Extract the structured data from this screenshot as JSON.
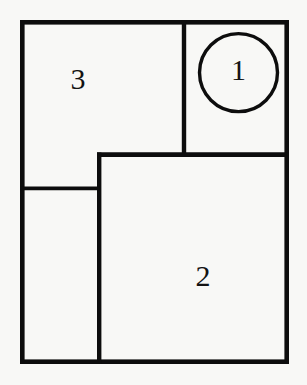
{
  "diagram": {
    "background_color": "#f8f8f6",
    "stroke_color": "#0d0d0d",
    "label_color": "#131313",
    "frame": {
      "name": "outer-rectangle",
      "x": 22.3,
      "y": 22.3,
      "width": 264.4,
      "height": 339.4,
      "stroke_width": 4.6
    },
    "dividers": [
      {
        "name": "divider-vertical-upper",
        "orientation": "vertical",
        "x1": 184.0,
        "y1": 20.0,
        "x2": 184.0,
        "y2": 156.5,
        "stroke_width": 4.4
      },
      {
        "name": "divider-horizontal-middle",
        "orientation": "horizontal",
        "x1": 97.0,
        "y1": 154.6,
        "x2": 289.0,
        "y2": 154.6,
        "stroke_width": 4.6
      },
      {
        "name": "divider-vertical-lower",
        "orientation": "vertical",
        "x1": 99.2,
        "y1": 152.4,
        "x2": 99.2,
        "y2": 364.0,
        "stroke_width": 4.4
      },
      {
        "name": "divider-horizontal-left",
        "orientation": "horizontal",
        "x1": 20.0,
        "y1": 188.3,
        "x2": 99.2,
        "y2": 188.3,
        "stroke_width": 3.8
      }
    ],
    "circle": {
      "name": "region-1-circle",
      "cx": 238.5,
      "cy": 72.6,
      "r": 39.0,
      "stroke_width": 3.4
    },
    "labels": [
      {
        "id": "label-3",
        "text": "3",
        "x": 78.0,
        "y": 82.0,
        "font_size": 30
      },
      {
        "id": "label-1",
        "text": "1",
        "x": 238.5,
        "y": 73.0,
        "font_size": 28
      },
      {
        "id": "label-2",
        "text": "2",
        "x": 203.0,
        "y": 279.0,
        "font_size": 30
      }
    ],
    "regions": [
      {
        "id": "region-3",
        "label": "3",
        "description": "upper-left region"
      },
      {
        "id": "region-1",
        "label": "1",
        "description": "upper-right region with circle"
      },
      {
        "id": "region-2",
        "label": "2",
        "description": "lower-right large region"
      },
      {
        "id": "region-unlabeled",
        "label": "",
        "description": "lower-left region"
      }
    ]
  }
}
